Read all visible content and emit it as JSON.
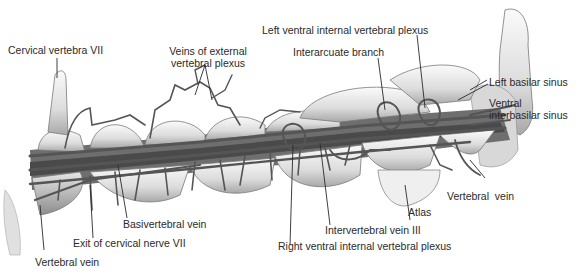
{
  "figure": {
    "colors": {
      "bone_light": "#f2f2f2",
      "bone_mid": "#d0d0d0",
      "bone_shadow": "#9a9a9a",
      "vein": "#5a5a5a",
      "vein_dark": "#3a3a3a",
      "leader": "#2a2a2a",
      "text": "#2a2a2a"
    }
  },
  "labels": {
    "cervical_vertebra_vii": "Cervical vertebra VII",
    "veins_external_plexus_1": "Veins of external",
    "veins_external_plexus_2": "vertebral plexus",
    "left_ventral_internal_plexus": "Left ventral internal vertebral plexus",
    "interarcuate_branch": "Interarcuate branch",
    "left_basilar_sinus": "Left basilar sinus",
    "ventral_interbasilar_sinus_1": "Ventral",
    "ventral_interbasilar_sinus_2": "interbasilar sinus",
    "vertebral_vein_right": "Vertebral  vein",
    "atlas": "Atlas",
    "intervertebral_vein_iii": "Intervertebral vein III",
    "right_ventral_internal_plexus": "Right ventral internal vertebral plexus",
    "basivertebral_vein": "Basivertebral vein",
    "exit_cervical_nerve_vii": "Exit of cervical nerve VII",
    "vertebral_vein_left": "Vertebral vein"
  }
}
